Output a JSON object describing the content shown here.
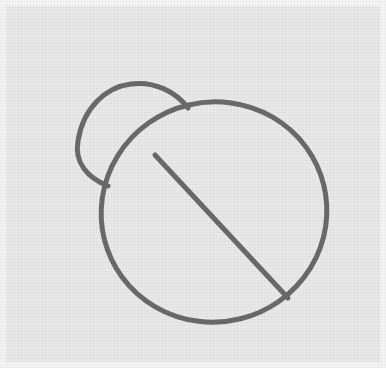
{
  "canvas": {
    "width": 386,
    "height": 368,
    "outer_background_color": "#f4f4f4",
    "panel_background_color": "#e9e9e9",
    "panel_x": 6,
    "panel_y": 6,
    "panel_width": 374,
    "panel_height": 356
  },
  "drawing": {
    "title": "beetle-outline-sketch",
    "style": "line-drawing",
    "stroke_color": "#6a6a6a",
    "stroke_width": 5,
    "fill": "none",
    "shapes": [
      {
        "name": "body-ellipse",
        "type": "ellipse",
        "cx": 214,
        "cy": 212,
        "rx": 113,
        "ry": 110,
        "rotation_deg": -14
      },
      {
        "name": "head-shield",
        "type": "arc-cap",
        "start_x": 188,
        "start_y": 108,
        "end_x": 108,
        "end_y": 186,
        "apex_x": 131,
        "apex_y": 84,
        "left_x": 78,
        "left_y": 141
      },
      {
        "name": "wing-divider-line",
        "type": "line",
        "x1": 155,
        "y1": 155,
        "x2": 288,
        "y2": 298
      }
    ]
  }
}
